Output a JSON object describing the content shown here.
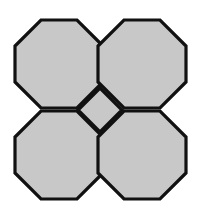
{
  "figure": {
    "type": "geometric-tiling-diagram",
    "background_color": "#ffffff",
    "fill_color": "#c8c8c8",
    "stroke_color": "#111111",
    "stroke_width": 3.2,
    "canvas": {
      "width": 201,
      "height": 212
    },
    "geometry": {
      "shape_count": 5,
      "octagon_count": 4,
      "square_count": 1,
      "octagon_width": 88,
      "octagon_height": 88,
      "corner_cut": 26,
      "center_point": {
        "x": 100,
        "y": 110
      },
      "diamond_half_diagonal": 22,
      "bounds": {
        "left": 15,
        "top": 20,
        "right": 186,
        "bottom": 199
      }
    },
    "shapes": [
      {
        "name": "octagon-top-left",
        "label": "Top-left octagon",
        "points": "41,20 77,20 103,46 103,82 77,108 41,108 15,82 15,46"
      },
      {
        "name": "octagon-top-right",
        "label": "Top-right octagon",
        "points": "124,20 160,20 186,46 186,82 160,108 124,108 98,82 98,46"
      },
      {
        "name": "octagon-bottom-left",
        "label": "Bottom-left octagon",
        "points": "41,111 77,111 103,137 103,173 77,199 41,199 15,173 15,137"
      },
      {
        "name": "octagon-bottom-right",
        "label": "Bottom-right octagon",
        "points": "124,111 160,111 186,137 186,173 160,199 124,199 98,173 98,137"
      },
      {
        "name": "square-center",
        "label": "Central square (diamond)",
        "points": "100,88 122,110 100,132 78,110"
      }
    ]
  }
}
